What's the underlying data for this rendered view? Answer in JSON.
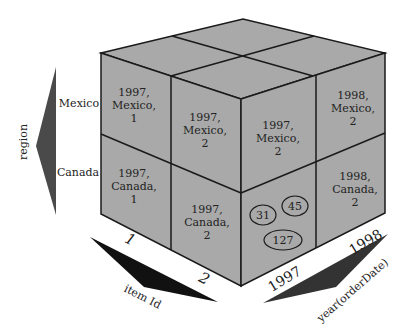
{
  "diagram": {
    "type": "data-cube",
    "colors": {
      "face": "#a9a9a9",
      "edge": "#1a1a1a",
      "arrow_region": "#4a4a4a",
      "arrow_item": "#111111",
      "arrow_year": "#333333"
    },
    "axes": {
      "region": {
        "label": "region",
        "values": [
          "Mexico",
          "Canada"
        ]
      },
      "item": {
        "label": "item Id",
        "values": [
          "1",
          "2"
        ]
      },
      "year": {
        "label": "year(orderDate)",
        "values": [
          "1997",
          "1998"
        ]
      }
    },
    "cells": {
      "left_mexico_1": [
        "1997,",
        "Mexico,",
        "1"
      ],
      "left_mexico_2": [
        "1997,",
        "Mexico,",
        "2"
      ],
      "left_canada_1": [
        "1997,",
        "Canada,",
        "1"
      ],
      "left_canada_2": [
        "1997,",
        "Canada,",
        "2"
      ],
      "right_mexico_1997": [
        "1997,",
        "Mexico,",
        "2"
      ],
      "right_mexico_1998": [
        "1998,",
        "Mexico,",
        "2"
      ],
      "right_canada_1998": [
        "1998,",
        "Canada,",
        "2"
      ]
    },
    "measures": [
      "31",
      "45",
      "127"
    ]
  }
}
